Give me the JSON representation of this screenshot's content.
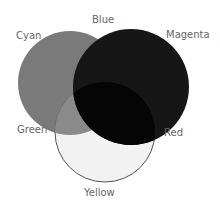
{
  "diagram": {
    "type": "venn",
    "labels": {
      "cyan": "Cyan",
      "blue": "Blue",
      "magenta": "Magenta",
      "green": "Green",
      "red": "Red",
      "yellow": "Yellow"
    },
    "circles": [
      {
        "name": "left",
        "fill": "#7a7a7a"
      },
      {
        "name": "right",
        "fill": "#1a1a1a"
      },
      {
        "name": "bottom",
        "fill": "#f2f2f2",
        "stroke": "#555555"
      }
    ]
  }
}
